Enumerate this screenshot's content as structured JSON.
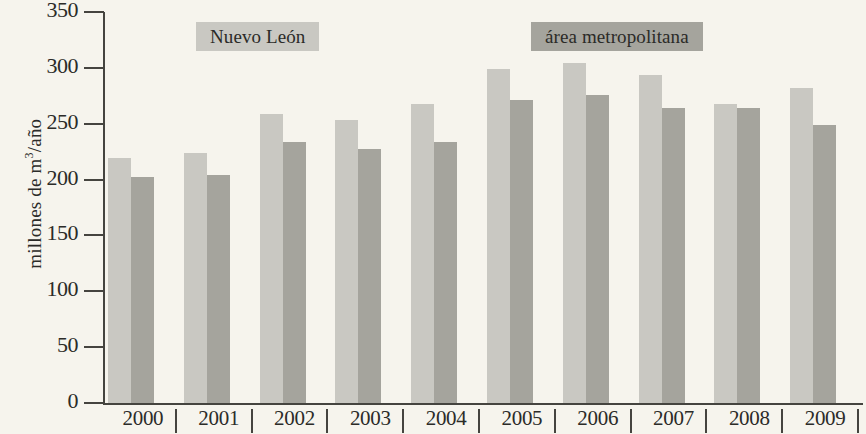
{
  "chart_data": {
    "type": "bar",
    "title": "",
    "xlabel": "",
    "ylabel_parts": {
      "pre": "millones de m",
      "sup": "3",
      "post": "/año"
    },
    "ylabel": "millones de m3/año",
    "categories": [
      "2000",
      "2001",
      "2002",
      "2003",
      "2004",
      "2005",
      "2006",
      "2007",
      "2008",
      "2009"
    ],
    "series": [
      {
        "name": "Nuevo León",
        "color": "#c9c8c2",
        "values": [
          219,
          224,
          259,
          253,
          268,
          299,
          304,
          294,
          268,
          282
        ]
      },
      {
        "name": "área metropolitana",
        "color": "#a5a49d",
        "values": [
          202,
          204,
          234,
          227,
          234,
          271,
          276,
          264,
          264,
          249
        ]
      }
    ],
    "ylim": [
      0,
      350
    ],
    "yticks": [
      0,
      50,
      100,
      150,
      200,
      250,
      300,
      350
    ],
    "ytick_labels": [
      "0",
      "50",
      "100",
      "150",
      "200",
      "250",
      "300",
      "350"
    ],
    "grid": false,
    "legend_position": "top",
    "axis_color": "#45443f",
    "background_color": "#f6f4ed"
  },
  "legend": [
    {
      "label": "Nuevo León"
    },
    {
      "label": "área metropolitana"
    }
  ]
}
